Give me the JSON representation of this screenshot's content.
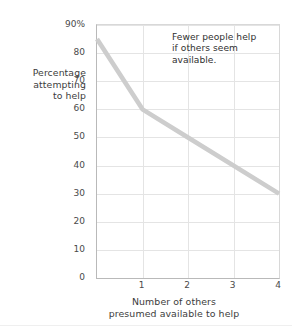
{
  "chart_data": {
    "type": "line",
    "title": "",
    "xlabel": "Number of others presumed available to help",
    "xlabel_lines": [
      "Number of others",
      "presumed available to help"
    ],
    "ylabel": "Percentage attempting to help",
    "ylabel_lines": [
      "Percentage",
      "attempting",
      "to help"
    ],
    "x": [
      0,
      1,
      2,
      4
    ],
    "values": [
      85,
      60,
      50,
      30
    ],
    "series": [
      {
        "name": "Percentage attempting to help",
        "x": [
          0,
          1,
          2,
          4
        ],
        "values": [
          85,
          60,
          50,
          30
        ],
        "color": "#cdcdcd"
      }
    ],
    "xlim": [
      0,
      4
    ],
    "ylim": [
      0,
      90
    ],
    "x_ticks": [
      1,
      2,
      3,
      4
    ],
    "x_ticklabels": [
      "1",
      "2",
      "3",
      "4"
    ],
    "y_ticks": [
      0,
      10,
      20,
      30,
      40,
      50,
      60,
      70,
      80,
      90
    ],
    "y_ticklabels": [
      "0",
      "10",
      "20",
      "30",
      "40",
      "50",
      "60",
      "70",
      "80",
      "90%"
    ],
    "grid": true,
    "legend": "none",
    "annotations": [
      {
        "text": "Fewer people help if others seem available.",
        "lines": [
          "Fewer people help",
          "if others seem",
          "available."
        ]
      }
    ]
  },
  "colors": {
    "line": "#cdcdcd",
    "grid": "#e4e4e4",
    "axis": "#b9b9b9",
    "text": "#3c3c3c",
    "background": "#ffffff"
  }
}
